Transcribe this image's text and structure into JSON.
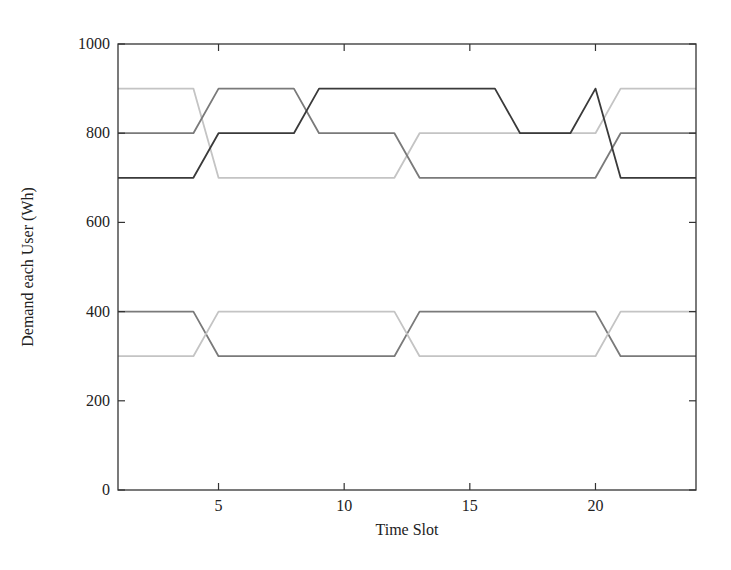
{
  "chart_data": {
    "type": "line",
    "title": "",
    "xlabel": "Time Slot",
    "ylabel": "Demand each User (Wh)",
    "xlim": [
      1,
      24
    ],
    "ylim": [
      0,
      1000
    ],
    "xticks": [
      5,
      10,
      15,
      20
    ],
    "yticks": [
      0,
      200,
      400,
      600,
      800,
      1000
    ],
    "grid": false,
    "legend": "none",
    "x": [
      1,
      2,
      3,
      4,
      5,
      6,
      7,
      8,
      9,
      10,
      11,
      12,
      13,
      14,
      15,
      16,
      17,
      18,
      19,
      20,
      21,
      22,
      23,
      24
    ],
    "series": [
      {
        "name": "User 1",
        "color": "#c4c4c4",
        "values": [
          900,
          900,
          900,
          900,
          700,
          700,
          700,
          700,
          700,
          700,
          700,
          700,
          800,
          800,
          800,
          800,
          800,
          800,
          800,
          800,
          900,
          900,
          900,
          900
        ]
      },
      {
        "name": "User 2",
        "color": "#7a7a7a",
        "values": [
          800,
          800,
          800,
          800,
          900,
          900,
          900,
          900,
          800,
          800,
          800,
          800,
          700,
          700,
          700,
          700,
          700,
          700,
          700,
          700,
          800,
          800,
          800,
          800
        ]
      },
      {
        "name": "User 3",
        "color": "#3a3a3a",
        "values": [
          700,
          700,
          700,
          700,
          800,
          800,
          800,
          800,
          900,
          900,
          900,
          900,
          900,
          900,
          900,
          900,
          800,
          800,
          800,
          900,
          700,
          700,
          700,
          700
        ]
      },
      {
        "name": "User 4",
        "color": "#7a7a7a",
        "values": [
          400,
          400,
          400,
          400,
          300,
          300,
          300,
          300,
          300,
          300,
          300,
          300,
          400,
          400,
          400,
          400,
          400,
          400,
          400,
          400,
          300,
          300,
          300,
          300
        ]
      },
      {
        "name": "User 5",
        "color": "#c4c4c4",
        "values": [
          300,
          300,
          300,
          300,
          400,
          400,
          400,
          400,
          400,
          400,
          400,
          400,
          300,
          300,
          300,
          300,
          300,
          300,
          300,
          300,
          400,
          400,
          400,
          400
        ]
      }
    ]
  }
}
